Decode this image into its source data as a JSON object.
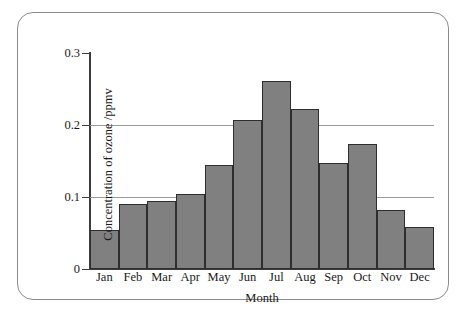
{
  "figure": {
    "frame_color": "#8a8a8a",
    "background": "#ffffff"
  },
  "chart_data": {
    "type": "bar",
    "title": "",
    "xlabel": "Month",
    "ylabel": "Concentration of ozone /ppmv",
    "categories": [
      "Jan",
      "Feb",
      "Mar",
      "Apr",
      "May",
      "Jun",
      "Jul",
      "Aug",
      "Sep",
      "Oct",
      "Nov",
      "Dec"
    ],
    "values": [
      0.054,
      0.09,
      0.094,
      0.104,
      0.144,
      0.207,
      0.261,
      0.222,
      0.147,
      0.174,
      0.082,
      0.058
    ],
    "ylim": [
      0,
      0.3
    ],
    "ytick_labels": [
      "0.3",
      "0.2",
      "0.1",
      "0"
    ],
    "ytick_values": [
      0.3,
      0.2,
      0.1,
      0
    ],
    "gridlines_at": [
      0.2,
      0.1
    ],
    "grid": true,
    "legend": "none",
    "bar_fill_color": "#808080",
    "bar_edge_color": "#2e2e2e",
    "axis_color": "#3c3c3c",
    "gridline_color": "#9a9a9a"
  }
}
